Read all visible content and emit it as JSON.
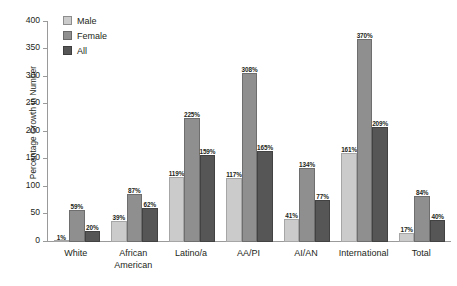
{
  "chart_data": {
    "type": "bar",
    "title": "",
    "xlabel": "",
    "ylabel": "Percentage Growth in Number",
    "ylim": [
      0,
      400
    ],
    "ytick_step": 50,
    "yticks": [
      0,
      50,
      100,
      150,
      200,
      250,
      300,
      350,
      400
    ],
    "ytick_labels": [
      "0",
      "50",
      "100",
      "150",
      "200",
      "250",
      "300",
      "350",
      "400"
    ],
    "grid": false,
    "legend_position": "top-left",
    "value_suffix": "%",
    "categories": [
      "White",
      "African American",
      "Latino/a",
      "AA/PI",
      "AI/AN",
      "International",
      "Total"
    ],
    "category_lines": [
      [
        "White"
      ],
      [
        "African",
        "American"
      ],
      [
        "Latino/a"
      ],
      [
        "AA/PI"
      ],
      [
        "AI/AN"
      ],
      [
        "International"
      ],
      [
        "Total"
      ]
    ],
    "series": [
      {
        "name": "Male",
        "color": "#cccbcb",
        "values": [
          1,
          39,
          119,
          117,
          41,
          161,
          17
        ],
        "labels": [
          "1%",
          "39%",
          "119%",
          "117%",
          "41%",
          "161%",
          "17%"
        ]
      },
      {
        "name": "Female",
        "color": "#908f8f",
        "values": [
          59,
          87,
          225,
          308,
          134,
          370,
          84
        ],
        "labels": [
          "59%",
          "87%",
          "225%",
          "308%",
          "134%",
          "370%",
          "84%"
        ]
      },
      {
        "name": "All",
        "color": "#575657",
        "values": [
          20,
          62,
          159,
          165,
          77,
          209,
          40
        ],
        "labels": [
          "20%",
          "62%",
          "159%",
          "165%",
          "77%",
          "209%",
          "40%"
        ]
      }
    ]
  },
  "legend": {
    "items": [
      {
        "label": "Male"
      },
      {
        "label": "Female"
      },
      {
        "label": "All"
      }
    ]
  },
  "colors": {
    "male": "#cccbcb",
    "female": "#908f8f",
    "all": "#575657",
    "axis": "#9a9a9a",
    "text": "#231f20",
    "background": "#ffffff"
  }
}
